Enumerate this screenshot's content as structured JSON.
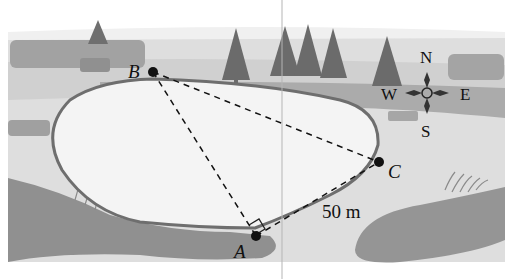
{
  "figure": {
    "points": [
      {
        "id": "A",
        "label": "A",
        "x": 256,
        "y": 236
      },
      {
        "id": "B",
        "label": "B",
        "x": 153,
        "y": 72
      },
      {
        "id": "C",
        "label": "C",
        "x": 379,
        "y": 162
      }
    ],
    "segments": [
      {
        "from": "B",
        "to": "A",
        "style": "dashed"
      },
      {
        "from": "B",
        "to": "C",
        "style": "dashed"
      },
      {
        "from": "A",
        "to": "C",
        "style": "dashed"
      }
    ],
    "right_angle_at": "A",
    "measurement": {
      "label": "50 m",
      "segment": "AC"
    },
    "compass": {
      "north": "N",
      "south": "S",
      "east": "E",
      "west": "W"
    }
  },
  "colors": {
    "sky": "#f6f6f6",
    "ground_light": "#dcdcdc",
    "ground_band": "#a9a9a9",
    "ground_mid": "#c4c4c4",
    "bank_dark": "#8f8f8f",
    "lake": "#f3f3f3",
    "shore": "#6e6e6e",
    "tree": "#6a6a6a",
    "bush": "#9a9a9a",
    "ink": "#111111"
  }
}
